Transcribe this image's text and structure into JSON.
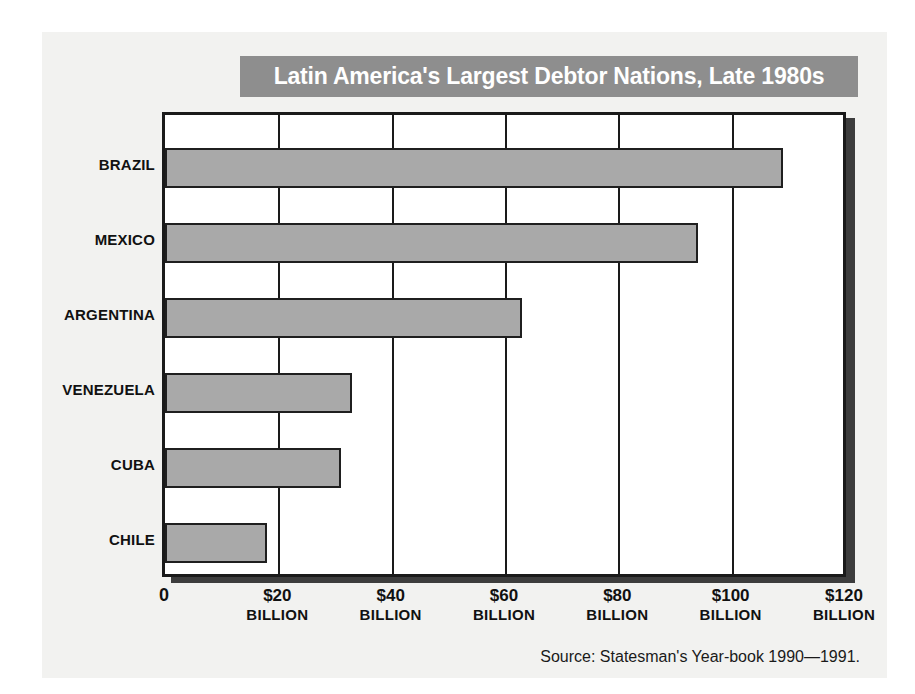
{
  "chart_data": {
    "type": "bar",
    "orientation": "horizontal",
    "title": "Latin America's Largest Debtor Nations, Late 1980s",
    "xlabel": "",
    "ylabel": "",
    "categories": [
      "BRAZIL",
      "MEXICO",
      "ARGENTINA",
      "VENEZUELA",
      "CUBA",
      "CHILE"
    ],
    "values": [
      109,
      94,
      63,
      33,
      31,
      18
    ],
    "unit": "$ BILLION",
    "xlim": [
      0,
      120
    ],
    "xticks": [
      0,
      20,
      40,
      60,
      80,
      100,
      120
    ],
    "xtick_labels": [
      "0",
      "$20",
      "$40",
      "$60",
      "$80",
      "$100",
      "$120"
    ],
    "xtick_units": [
      "",
      "BILLION",
      "BILLION",
      "BILLION",
      "BILLION",
      "BILLION",
      "BILLION"
    ],
    "grid": true,
    "grid_axis": "x",
    "legend": null,
    "source_note": "Source: Statesman's Year-book 1990—1991.",
    "colors": {
      "bar_fill": "#a9a9a9",
      "bar_border": "#1f1f1f",
      "title_banner": "#8e8e8e",
      "title_text": "#ffffff",
      "plot_background": "#ffffff",
      "frame": "#1a1a1a",
      "paper": "#f2f2f0",
      "shadow": "#3d3d3d"
    }
  }
}
